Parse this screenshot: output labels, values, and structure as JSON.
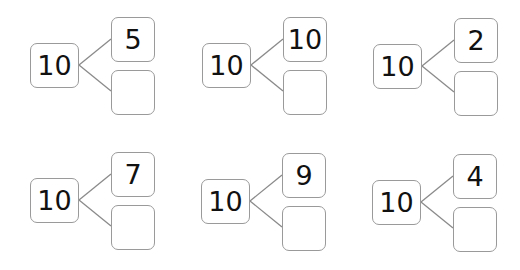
{
  "worksheet": {
    "bonds": [
      {
        "whole": "10",
        "part_top": "5",
        "part_bottom": ""
      },
      {
        "whole": "10",
        "part_top": "10",
        "part_bottom": ""
      },
      {
        "whole": "10",
        "part_top": "2",
        "part_bottom": ""
      },
      {
        "whole": "10",
        "part_top": "7",
        "part_bottom": ""
      },
      {
        "whole": "10",
        "part_top": "9",
        "part_bottom": ""
      },
      {
        "whole": "10",
        "part_top": "4",
        "part_bottom": ""
      }
    ]
  },
  "colors": {
    "box_border": "#9a9a9a",
    "line": "#8a8a8a",
    "text": "#111111"
  }
}
